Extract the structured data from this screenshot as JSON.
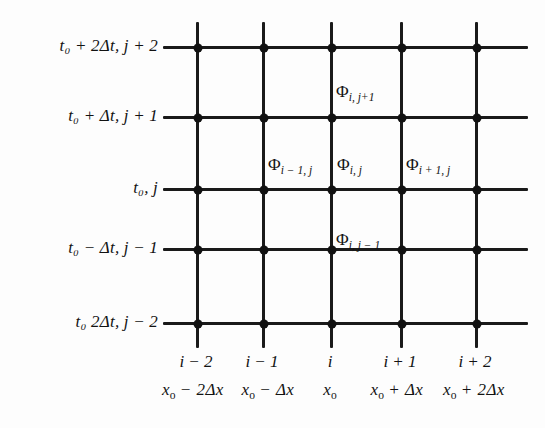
{
  "figure": {
    "kind": "finite-difference-grid-diagram",
    "background_color": "#fdfdfd",
    "line_color": "#1a1a1a",
    "node_color": "#111111"
  },
  "time_axis": {
    "name": "time-axis-labels",
    "labels": [
      {
        "id": "t-plus-2dt",
        "text": "t₀ + 2Δt, j + 2",
        "t_part": "t",
        "t_sub": "o",
        "rest": "+ 2Δt, j + 2",
        "y": 46
      },
      {
        "id": "t-plus-dt",
        "text": "t₀ + Δt, j + 1",
        "t_part": "t",
        "t_sub": "o",
        "rest": "+ Δt, j + 1",
        "y": 116
      },
      {
        "id": "t-zero",
        "text": "t₀, j",
        "t_part": "t",
        "t_sub": "o",
        "rest": ", j",
        "y": 188
      },
      {
        "id": "t-minus-dt",
        "text": "t₀ − Δt, j − 1",
        "t_part": "t",
        "t_sub": "o",
        "rest": "− Δt, j − 1",
        "y": 248
      },
      {
        "id": "t-minus-2dt",
        "text": "t₀  2Δt, j − 2",
        "t_part": "t",
        "t_sub": "o",
        "rest": "2Δt, j − 2",
        "y": 322
      }
    ]
  },
  "space_axis": {
    "name": "space-axis-labels",
    "index_row": [
      {
        "id": "i-minus-2",
        "text": "i − 2",
        "x": 196
      },
      {
        "id": "i-minus-1",
        "text": "i − 1",
        "x": 262
      },
      {
        "id": "i-center",
        "text": "i",
        "x": 330
      },
      {
        "id": "i-plus-1",
        "text": "i + 1",
        "x": 400
      },
      {
        "id": "i-plus-2",
        "text": "i + 2",
        "x": 475
      }
    ],
    "coordinate_row": [
      {
        "id": "x-minus-2dx",
        "x_part": "x",
        "x_sub": "o",
        "rest": "− 2Δx",
        "x": 193
      },
      {
        "id": "x-minus-dx",
        "x_part": "x",
        "x_sub": "o",
        "rest": "− Δx",
        "x": 268
      },
      {
        "id": "x-zero",
        "x_part": "x",
        "x_sub": "o",
        "rest": "",
        "x": 330
      },
      {
        "id": "x-plus-dx",
        "x_part": "x",
        "x_sub": "o",
        "rest": "+ Δx",
        "x": 397
      },
      {
        "id": "x-plus-2dx",
        "x_part": "x",
        "x_sub": "o",
        "rest": "+ 2Δx",
        "x": 474
      }
    ]
  },
  "node_labels": [
    {
      "id": "phi-i-j-plus-1",
      "glyph": "Φ",
      "subscript": "i, j+1",
      "x": 336,
      "y": 92
    },
    {
      "id": "phi-i-minus-1-j",
      "glyph": "Φ",
      "subscript": "i − 1, j",
      "x": 268,
      "y": 165
    },
    {
      "id": "phi-i-j",
      "glyph": "Φ",
      "subscript": "i, j",
      "x": 337,
      "y": 165
    },
    {
      "id": "phi-i-plus-1-j",
      "glyph": "Φ",
      "subscript": "i + 1, j",
      "x": 406,
      "y": 165
    },
    {
      "id": "phi-i-j-minus-1",
      "glyph": "Φ",
      "subscript": "i, j − 1",
      "x": 336,
      "y": 240
    }
  ],
  "grid": {
    "vertical_lines_x": [
      196,
      262,
      330,
      400,
      475
    ],
    "vertical_top": 22,
    "vertical_bottom": 348,
    "horizontal_lines_y": [
      46,
      116,
      188,
      248,
      322
    ],
    "horizontal_left": 163,
    "horizontal_right": 528
  }
}
